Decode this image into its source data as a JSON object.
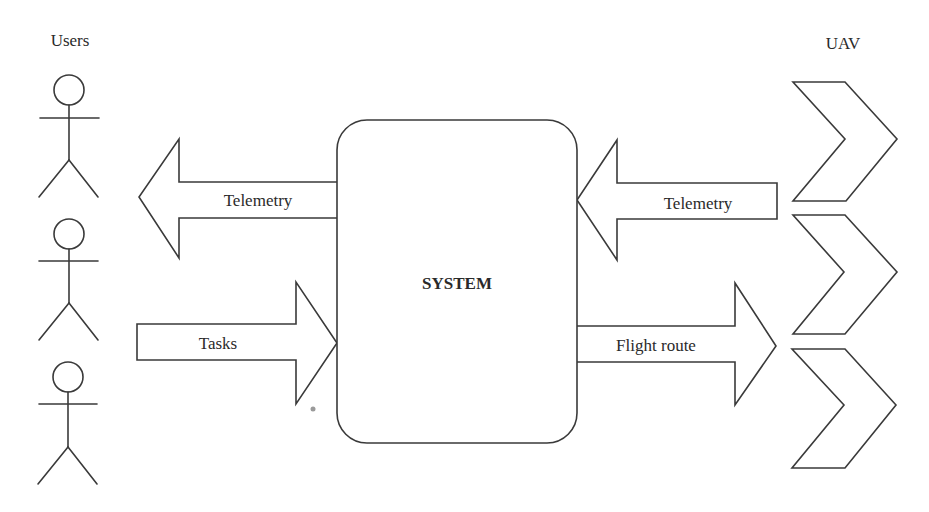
{
  "labels": {
    "users": "Users",
    "uav": "UAV",
    "system": "SYSTEM"
  },
  "arrows": {
    "telemetry_to_users": "Telemetry",
    "tasks_to_system": "Tasks",
    "telemetry_from_uav": "Telemetry",
    "flight_route_to_uav": "Flight route"
  },
  "actors": {
    "count": 3,
    "type": "stick-figure-user"
  },
  "uavs": {
    "count": 3,
    "type": "chevron-uav"
  },
  "colors": {
    "stroke": "#3a3a3a",
    "background": "#ffffff",
    "text": "#2a2a2a"
  }
}
